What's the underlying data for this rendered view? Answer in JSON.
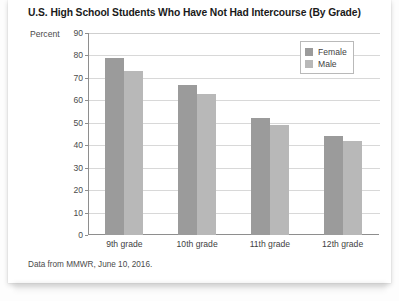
{
  "card": {
    "source_note": "Data from MMWR, June 10, 2016."
  },
  "chart_data": {
    "type": "bar",
    "title": "U.S. High School Students Who Have Not Had Intercourse (By Grade)",
    "xlabel": "",
    "ylabel": "Percent",
    "ylim": [
      0,
      90
    ],
    "ytick_step": 10,
    "yticks": [
      "90",
      "80",
      "70",
      "60",
      "50",
      "40",
      "30",
      "20",
      "10",
      "0"
    ],
    "grid": true,
    "legend_position": "top-right",
    "categories": [
      "9th grade",
      "10th grade",
      "11th grade",
      "12th grade"
    ],
    "series": [
      {
        "name": "Female",
        "color": "#9b9b9b",
        "values": [
          79,
          67,
          52,
          44
        ]
      },
      {
        "name": "Male",
        "color": "#b8b8b8",
        "values": [
          73,
          63,
          49,
          42
        ]
      }
    ]
  }
}
